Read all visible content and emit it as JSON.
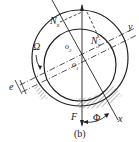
{
  "diagram": {
    "type": "journal-bearing-force-diagram",
    "labels": {
      "normal_force_x": "N",
      "normal_force_x_sub": "x",
      "normal_force_y": "N",
      "normal_force_y_sub": "y",
      "angular_velocity": "Ω",
      "bearing_center": "o",
      "bearing_center_sub": "2",
      "journal_center": "o",
      "journal_center_sub": "1",
      "eccentricity": "e",
      "load": "F",
      "attitude_angle": "Φ",
      "axis_x": "x",
      "axis_y": "y"
    },
    "caption": "(b)",
    "colors": {
      "line": "#222222",
      "hatch": "#777777",
      "background": "#ffffff"
    }
  }
}
